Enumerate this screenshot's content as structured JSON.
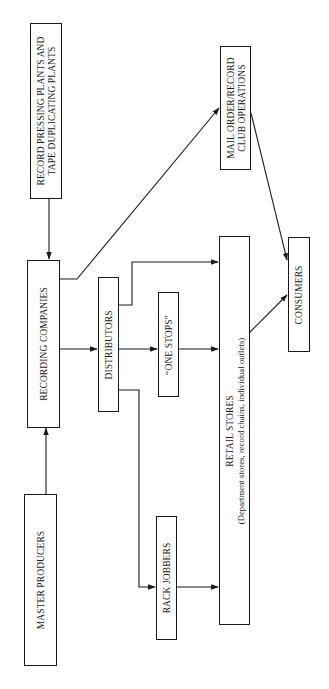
{
  "diagram": {
    "nodes": {
      "record_pressing": {
        "line1": "RECORD PRESSING PLANTS AND",
        "line2": "TAPE DUPLICATING PLANTS"
      },
      "mail_order": {
        "line1": "MAIL ORDER/RECORD",
        "line2": "CLUB OPERATIONS"
      },
      "recording_companies": {
        "label": "RECORDING COMPANIES"
      },
      "distributors": {
        "label": "DISTRIBUTORS"
      },
      "one_stops": {
        "label": "“ONE STOPS”"
      },
      "retail_stores": {
        "label": "RETAIL STORES",
        "sublabel": "(Department stores, record chains, individual outlets)"
      },
      "consumers": {
        "label": "CONSUMERS"
      },
      "master_producers": {
        "label": "MASTER PRODUCERS"
      },
      "rack_jobbers": {
        "label": "RACK JOBBERS"
      }
    },
    "edges": [
      {
        "from": "RECORD PRESSING PLANTS AND TAPE DUPLICATING PLANTS",
        "to": "RECORDING COMPANIES"
      },
      {
        "from": "MASTER PRODUCERS",
        "to": "RECORDING COMPANIES"
      },
      {
        "from": "RECORDING COMPANIES",
        "to": "MAIL ORDER/RECORD CLUB OPERATIONS"
      },
      {
        "from": "RECORDING COMPANIES",
        "to": "DISTRIBUTORS"
      },
      {
        "from": "DISTRIBUTORS",
        "to": "RETAIL STORES"
      },
      {
        "from": "DISTRIBUTORS",
        "to": "ONE STOPS"
      },
      {
        "from": "DISTRIBUTORS",
        "to": "RACK JOBBERS"
      },
      {
        "from": "ONE STOPS",
        "to": "RETAIL STORES"
      },
      {
        "from": "RACK JOBBERS",
        "to": "RETAIL STORES"
      },
      {
        "from": "RETAIL STORES",
        "to": "CONSUMERS"
      },
      {
        "from": "MAIL ORDER/RECORD CLUB OPERATIONS",
        "to": "CONSUMERS"
      }
    ]
  }
}
